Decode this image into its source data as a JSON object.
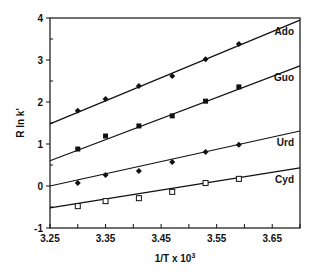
{
  "chart_data": {
    "type": "scatter",
    "title": "",
    "xlabel": "1/T x 10",
    "xlabel_superscript": "3",
    "ylabel": "R ln k'",
    "xlim": [
      3.25,
      3.7
    ],
    "ylim": [
      -1,
      4
    ],
    "x_ticks": [
      "3.25",
      "3.35",
      "3.45",
      "3.55",
      "3.65"
    ],
    "x_tick_values": [
      3.25,
      3.35,
      3.45,
      3.55,
      3.65
    ],
    "x_minor_step": 0.05,
    "y_ticks": [
      "-1",
      "0",
      "1",
      "2",
      "3",
      "4"
    ],
    "y_tick_values": [
      -1,
      0,
      1,
      2,
      3,
      4
    ],
    "y_minor_step": 0.5,
    "grid": false,
    "legend": "inline labels at right end of each fitted line",
    "x": [
      3.3,
      3.35,
      3.41,
      3.47,
      3.53,
      3.59
    ],
    "series": [
      {
        "name": "Ado",
        "marker": "filled-diamond",
        "values": [
          1.79,
          2.07,
          2.38,
          2.62,
          3.02,
          3.38
        ],
        "fit_line": [
          [
            3.25,
            1.48
          ],
          [
            3.7,
            3.95
          ]
        ]
      },
      {
        "name": "Guo",
        "marker": "filled-square",
        "values": [
          0.88,
          1.19,
          1.43,
          1.67,
          2.02,
          2.36
        ],
        "fit_line": [
          [
            3.25,
            0.6
          ],
          [
            3.7,
            2.86
          ]
        ]
      },
      {
        "name": "Urd",
        "marker": "filled-diamond",
        "values": [
          0.07,
          0.26,
          0.36,
          0.57,
          0.81,
          0.98
        ],
        "fit_line": [
          [
            3.25,
            0.0
          ],
          [
            3.7,
            1.31
          ]
        ]
      },
      {
        "name": "Cyd",
        "marker": "open-square",
        "values": [
          -0.48,
          -0.36,
          -0.29,
          -0.14,
          0.07,
          0.17
        ],
        "fit_line": [
          [
            3.25,
            -0.52
          ],
          [
            3.7,
            0.43
          ]
        ]
      }
    ]
  }
}
